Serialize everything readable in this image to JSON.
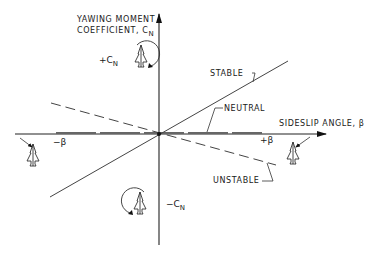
{
  "diagram": {
    "y_axis": {
      "label_line1": "YAWING MOMENT",
      "label_line2": "COEFFICIENT, C",
      "label_sub": "N",
      "positive": "+C",
      "positive_sub": "N",
      "negative": "−C",
      "negative_sub": "N"
    },
    "x_axis": {
      "label": "SIDESLIP ANGLE, β",
      "positive": "+β",
      "negative": "−β"
    },
    "lines": [
      {
        "name": "STABLE",
        "style": "solid",
        "slope": "positive"
      },
      {
        "name": "NEUTRAL",
        "style": "long-dash",
        "slope": "zero"
      },
      {
        "name": "UNSTABLE",
        "style": "dashed",
        "slope": "negative"
      }
    ],
    "icons": {
      "plus_cn": "airplane-nose-right-yaw-icon",
      "minus_cn": "airplane-nose-left-yaw-icon",
      "plus_beta": "airplane-sideslip-right-icon",
      "minus_beta": "airplane-sideslip-left-icon"
    }
  }
}
